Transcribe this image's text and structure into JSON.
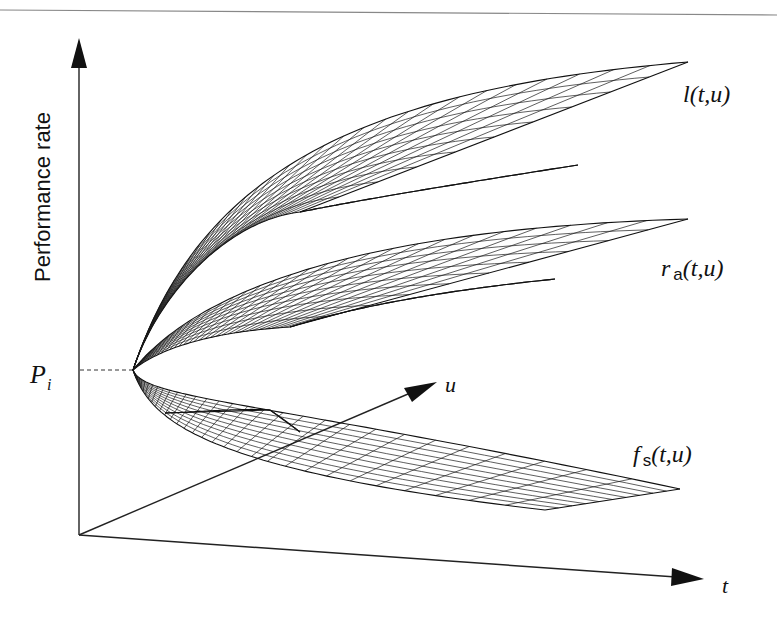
{
  "header": {
    "rule_color": "#888888"
  },
  "axes": {
    "y_label": "Performance rate",
    "t_label": "t",
    "u_label": "u",
    "pi_label_main": "P",
    "pi_label_sub": "i"
  },
  "surfaces": [
    {
      "name": "l",
      "label_main": "l(t,u)",
      "label_sub": ""
    },
    {
      "name": "r_a",
      "label_main": "r",
      "label_sub": "a",
      "label_tail": "(t,u)"
    },
    {
      "name": "f_s",
      "label_main": "f",
      "label_sub": "s",
      "label_tail": "(t,u)"
    }
  ],
  "colors": {
    "ink": "#111111",
    "background": "#ffffff"
  }
}
